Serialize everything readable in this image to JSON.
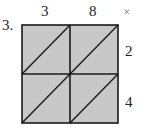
{
  "problem": {
    "number": "3.",
    "top_factor_digits": [
      "3",
      "8"
    ],
    "operator": "×",
    "right_factor_digits": [
      "2",
      "4"
    ],
    "grid": {
      "rows": 2,
      "cols": 2,
      "fill_color": "#c8c8c8",
      "line_color": "#1a1a1a",
      "cells": [
        {
          "row": 0,
          "col": 0,
          "value": ""
        },
        {
          "row": 0,
          "col": 1,
          "value": ""
        },
        {
          "row": 1,
          "col": 0,
          "value": ""
        },
        {
          "row": 1,
          "col": 1,
          "value": ""
        }
      ]
    }
  }
}
